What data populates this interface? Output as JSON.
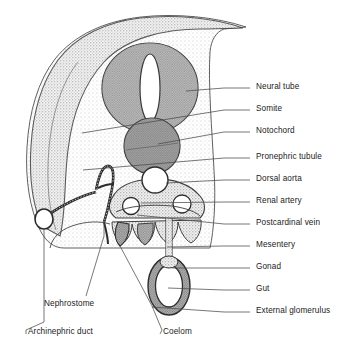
{
  "figure": {
    "background_color": "#ffffff",
    "ink_color": "#1b1b1b",
    "leader_color": "#4a4a4a",
    "tissue_fill": "#e8e8e8",
    "somite_fill": "#c9c9c9",
    "notochord_fill": "#9e9e9e",
    "lumen_fill": "#ffffff"
  },
  "labels_right": [
    {
      "id": "neural-tube",
      "text": "Neural tube",
      "x": 256,
      "y": 88,
      "leader_from_x": 250,
      "leader_from_y": 88,
      "leader_to_x": 186,
      "leader_to_y": 91
    },
    {
      "id": "somite",
      "text": "Somite",
      "x": 256,
      "y": 110,
      "leader_from_x": 250,
      "leader_from_y": 110,
      "leader_to_x": 82,
      "leader_to_y": 133
    },
    {
      "id": "notochord",
      "text": "Notochord",
      "x": 256,
      "y": 132,
      "leader_from_x": 250,
      "leader_from_y": 132,
      "leader_to_x": 158,
      "leader_to_y": 144
    },
    {
      "id": "pronephric-tubule",
      "text": "Pronephric tubule",
      "x": 256,
      "y": 158,
      "leader_from_x": 250,
      "leader_from_y": 158,
      "leader_to_x": 83,
      "leader_to_y": 170
    },
    {
      "id": "dorsal-aorta",
      "text": "Dorsal aorta",
      "x": 256,
      "y": 180,
      "leader_from_x": 250,
      "leader_from_y": 180,
      "leader_to_x": 166,
      "leader_to_y": 183
    },
    {
      "id": "renal-artery",
      "text": "Renal artery",
      "x": 256,
      "y": 202,
      "leader_from_x": 250,
      "leader_from_y": 202,
      "leader_to_x": 141,
      "leader_to_y": 203
    },
    {
      "id": "postcardinal-vein",
      "text": "Postcardinal vein",
      "x": 256,
      "y": 224,
      "leader_from_x": 250,
      "leader_from_y": 224,
      "leader_to_x": 137,
      "leader_to_y": 215
    },
    {
      "id": "mesentery",
      "text": "Mesentery",
      "x": 256,
      "y": 246,
      "leader_from_x": 250,
      "leader_from_y": 246,
      "leader_to_x": 167,
      "leader_to_y": 247
    },
    {
      "id": "gonad",
      "text": "Gonad",
      "x": 256,
      "y": 268,
      "leader_from_x": 250,
      "leader_from_y": 268,
      "leader_to_x": 172,
      "leader_to_y": 268
    },
    {
      "id": "gut",
      "text": "Gut",
      "x": 256,
      "y": 290,
      "leader_from_x": 250,
      "leader_from_y": 290,
      "leader_to_x": 168,
      "leader_to_y": 288
    },
    {
      "id": "external-glomerulus",
      "text": "External glomerulus",
      "x": 256,
      "y": 312,
      "leader_from_x": 250,
      "leader_from_y": 312,
      "leader_to_x": 152,
      "leader_to_y": 307
    }
  ],
  "labels_left": [
    {
      "id": "nephrostome",
      "text": "Nephrostome",
      "x": 44,
      "y": 305
    },
    {
      "id": "archinephric-duct",
      "text": "Archinephric duct",
      "x": 28,
      "y": 333
    },
    {
      "id": "coelom",
      "text": "Coelom",
      "x": 163,
      "y": 333
    }
  ]
}
